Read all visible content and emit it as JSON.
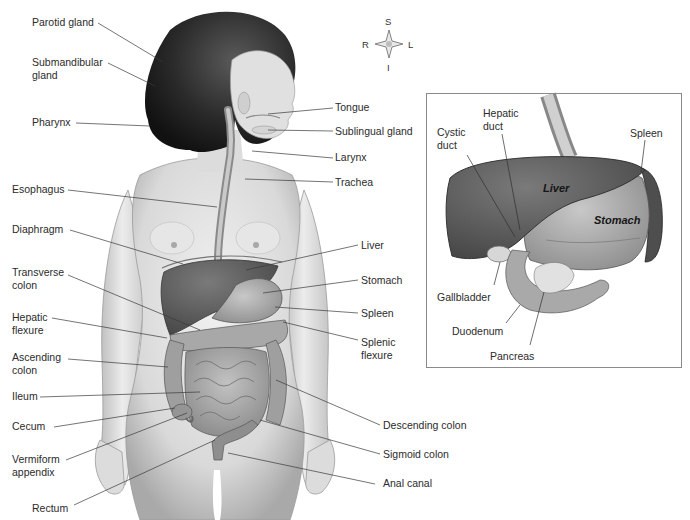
{
  "figure": {
    "compass": {
      "superior": "S",
      "inferior": "I",
      "right": "R",
      "left": "L"
    },
    "main_labels_left": [
      {
        "id": "parotid-gland",
        "text": "Parotid gland"
      },
      {
        "id": "submandibular-gland",
        "text": "Submandibular\ngland"
      },
      {
        "id": "pharynx",
        "text": "Pharynx"
      },
      {
        "id": "esophagus",
        "text": "Esophagus"
      },
      {
        "id": "diaphragm",
        "text": "Diaphragm"
      },
      {
        "id": "transverse-colon",
        "text": "Transverse\ncolon"
      },
      {
        "id": "hepatic-flexure",
        "text": "Hepatic\nflexure"
      },
      {
        "id": "ascending-colon",
        "text": "Ascending\ncolon"
      },
      {
        "id": "ileum",
        "text": "Ileum"
      },
      {
        "id": "cecum",
        "text": "Cecum"
      },
      {
        "id": "vermiform-appendix",
        "text": "Vermiform\nappendix"
      },
      {
        "id": "rectum",
        "text": "Rectum"
      }
    ],
    "main_labels_right": [
      {
        "id": "tongue",
        "text": "Tongue"
      },
      {
        "id": "sublingual-gland",
        "text": "Sublingual gland"
      },
      {
        "id": "larynx",
        "text": "Larynx"
      },
      {
        "id": "trachea",
        "text": "Trachea"
      },
      {
        "id": "liver",
        "text": "Liver"
      },
      {
        "id": "stomach",
        "text": "Stomach"
      },
      {
        "id": "spleen",
        "text": "Spleen"
      },
      {
        "id": "splenic-flexure",
        "text": "Splenic\nflexure"
      },
      {
        "id": "descending-colon",
        "text": "Descending colon"
      },
      {
        "id": "sigmoid-colon",
        "text": "Sigmoid colon"
      },
      {
        "id": "anal-canal",
        "text": "Anal canal"
      }
    ],
    "inset": {
      "organ_labels": {
        "liver": "Liver",
        "stomach": "Stomach"
      },
      "labels": [
        {
          "id": "cystic-duct",
          "text": "Cystic\nduct"
        },
        {
          "id": "hepatic-duct",
          "text": "Hepatic\nduct"
        },
        {
          "id": "spleen",
          "text": "Spleen"
        },
        {
          "id": "gallbladder",
          "text": "Gallbladder"
        },
        {
          "id": "duodenum",
          "text": "Duodenum"
        },
        {
          "id": "pancreas",
          "text": "Pancreas"
        }
      ]
    },
    "colors": {
      "skin": "#e2e2e2",
      "skin_shadow": "#b5b5b5",
      "hair": "#262626",
      "liver": "#5a5a5a",
      "stomach": "#a3a3a3",
      "intestine": "#9a9a9a",
      "leader_line": "#3a3a3a",
      "inset_border": "#8a8a8a"
    }
  }
}
